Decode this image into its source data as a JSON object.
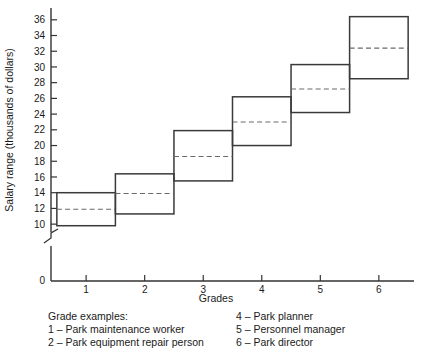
{
  "chart_data": {
    "type": "bar",
    "title": "",
    "subtitle": "",
    "xlabel": "Grades",
    "ylabel": "Salary range (thousands of dollars)",
    "categories": [
      "1",
      "2",
      "3",
      "4",
      "5",
      "6"
    ],
    "xlim": [
      0.4,
      6.6
    ],
    "ylim": [
      9,
      37.5
    ],
    "yticks": [
      10,
      12,
      14,
      16,
      18,
      20,
      22,
      24,
      26,
      28,
      30,
      32,
      34,
      36
    ],
    "ytick_labels": [
      "10",
      "12",
      "14",
      "16",
      "18",
      "20",
      "22",
      "24",
      "26",
      "28",
      "30",
      "32",
      "34",
      "36"
    ],
    "zero_tick_label": "0",
    "axis_break": true,
    "grid": false,
    "legend_position": "below",
    "series": [
      {
        "name": "Range minimum",
        "values": [
          9.8,
          11.3,
          15.5,
          20.0,
          24.2,
          28.5
        ]
      },
      {
        "name": "Range midpoint",
        "values": [
          11.9,
          13.9,
          18.6,
          23.0,
          27.2,
          32.4
        ]
      },
      {
        "name": "Range maximum",
        "values": [
          14.0,
          16.4,
          21.9,
          26.2,
          30.3,
          36.4
        ]
      }
    ],
    "box_half_width": 0.5,
    "annotations": []
  },
  "axis": {
    "y_title": "Salary range (thousands of dollars)",
    "x_title": "Grades",
    "x_tick_labels": [
      "1",
      "2",
      "3",
      "4",
      "5",
      "6"
    ],
    "y_tick_labels": [
      "36",
      "34",
      "32",
      "30",
      "28",
      "26",
      "24",
      "22",
      "20",
      "18",
      "16",
      "14",
      "12",
      "10"
    ],
    "origin_label": "0"
  },
  "legend": {
    "heading": "Grade examples:",
    "left_column": [
      "1 – Park maintenance worker",
      "2 – Park equipment repair person"
    ],
    "right_column": [
      "4 – Park planner",
      "5 – Personnel manager",
      "6 – Park director"
    ]
  },
  "colors": {
    "box_stroke": "#3a3a3a",
    "mid_line": "#6a6a6a",
    "axis": "#333333",
    "text": "#1a1a1a",
    "background": "#ffffff"
  }
}
